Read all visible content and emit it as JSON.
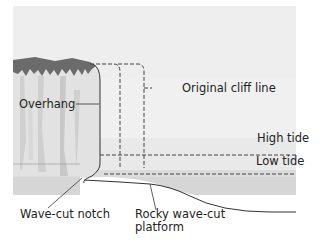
{
  "diagram": {
    "labels": {
      "original_cliff_line": "Original cliff line",
      "overhang": "Overhang",
      "high_tide": "High tide",
      "low_tide": "Low tide",
      "wave_cut_notch": "Wave-cut notch",
      "platform_line1": "Rocky wave-cut",
      "platform_line2": "platform"
    },
    "colors": {
      "sky": "#ececec",
      "cliff": "#e6e6e6",
      "cliff_top": "#6b6b6b",
      "water": "#d6d6d6",
      "line": "#333333"
    }
  }
}
